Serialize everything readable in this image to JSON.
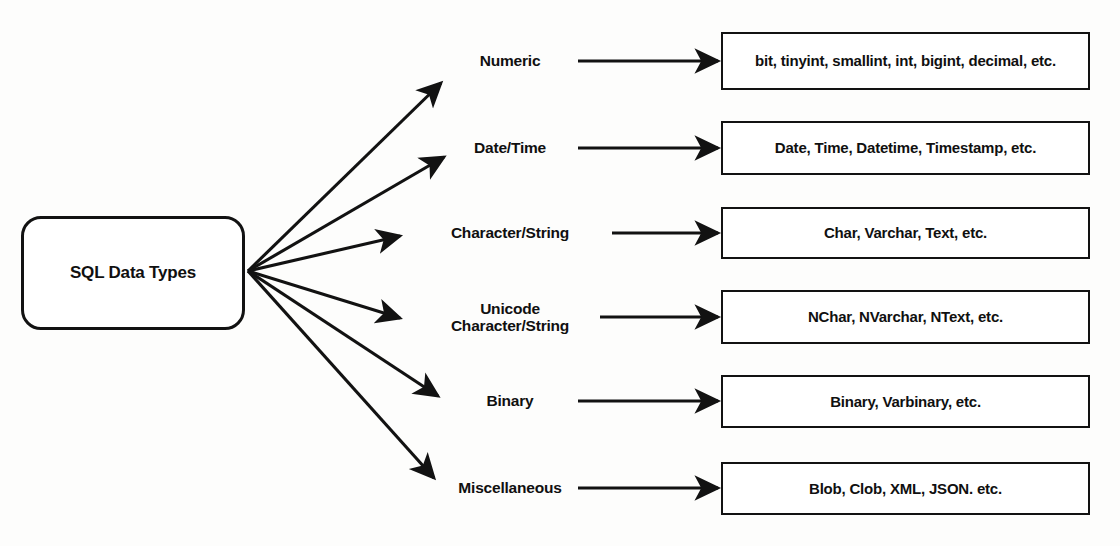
{
  "diagram": {
    "title": "SQL Data Types",
    "root": {
      "label": "SQL Data Types"
    },
    "colors": {
      "stroke": "#121212",
      "text": "#101010",
      "background": "#fdfdfc",
      "box_fill": "#ffffff"
    },
    "branches": [
      {
        "category": "Numeric",
        "values": "bit, tinyint, smallint, int, bigint, decimal, etc."
      },
      {
        "category": "Date/Time",
        "values": "Date, Time, Datetime, Timestamp, etc."
      },
      {
        "category": "Character/String",
        "values": "Char, Varchar, Text, etc."
      },
      {
        "category": "Unicode\nCharacter/String",
        "values": "NChar, NVarchar, NText, etc."
      },
      {
        "category": "Binary",
        "values": "Binary, Varbinary, etc."
      },
      {
        "category": "Miscellaneous",
        "values": "Blob, Clob, XML, JSON. etc."
      }
    ]
  }
}
